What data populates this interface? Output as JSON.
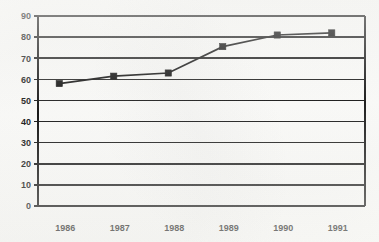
{
  "chart_data": {
    "type": "line",
    "title": "",
    "subtitle": "",
    "xlabel": "",
    "ylabel": "",
    "categories": [
      "1986",
      "1987",
      "1988",
      "1989",
      "1990",
      "1991"
    ],
    "x": [
      1986,
      1987,
      1988,
      1989,
      1990,
      1991
    ],
    "values": [
      58,
      61.5,
      63,
      75.5,
      81,
      82
    ],
    "series": [
      {
        "name": "",
        "values": [
          58,
          61.5,
          63,
          75.5,
          81,
          82
        ],
        "marker": "square",
        "color": "#0a0a0a"
      }
    ],
    "ylim": [
      0,
      90
    ],
    "y_ticks": [
      0,
      10,
      20,
      30,
      40,
      50,
      60,
      70,
      80,
      90
    ],
    "y_tick_labels": [
      "0",
      "10",
      "20",
      "30",
      "40",
      "50",
      "60",
      "70",
      "80",
      "90"
    ],
    "x_tick_labels": [
      "1986",
      "1987",
      "1988",
      "1989",
      "1990",
      "1991"
    ],
    "grid": "horizontal",
    "legend": "none",
    "annotations": []
  },
  "axes": {
    "y_axis_name": "y-axis",
    "x_axis_name": "x-axis"
  }
}
